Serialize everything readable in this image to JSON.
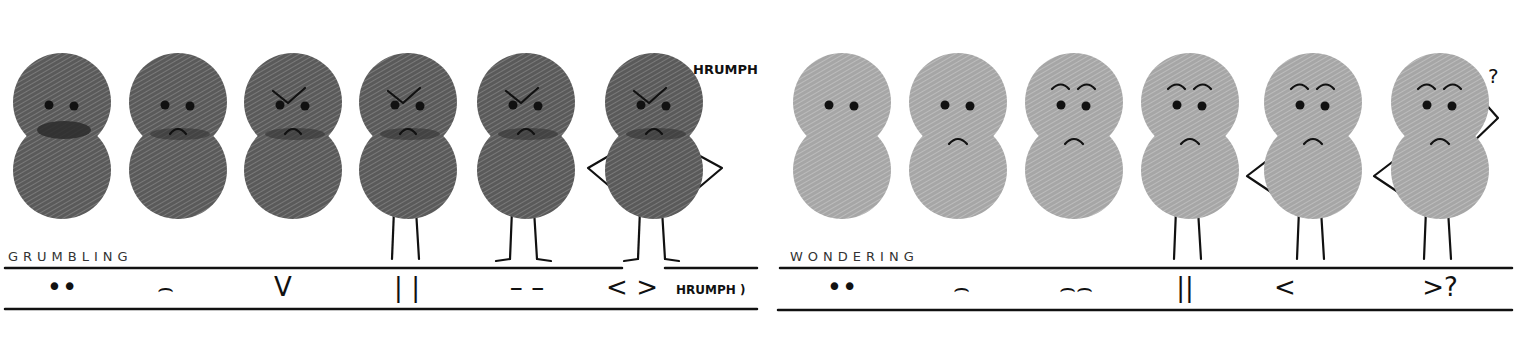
{
  "sections": [
    {
      "title": "GRUMBLING",
      "body_color": "#5e5e5e",
      "figures": [
        {
          "cx": 62,
          "eyes": true,
          "brows": "none",
          "mouth": "scribble",
          "legs": false,
          "arms": "none"
        },
        {
          "cx": 178,
          "eyes": true,
          "brows": "none",
          "mouth": "frown-scribble",
          "legs": false,
          "arms": "none"
        },
        {
          "cx": 293,
          "eyes": true,
          "brows": "angry-v",
          "mouth": "frown-scribble",
          "legs": false,
          "arms": "none"
        },
        {
          "cx": 408,
          "eyes": true,
          "brows": "angry-v",
          "mouth": "frown-scribble",
          "legs": "straight",
          "arms": "none"
        },
        {
          "cx": 526,
          "eyes": true,
          "brows": "angry-v",
          "mouth": "frown-scribble",
          "legs": "feet",
          "arms": "none"
        },
        {
          "cx": 654,
          "eyes": true,
          "brows": "angry-v",
          "mouth": "frown-scribble",
          "legs": "feet",
          "arms": "hips"
        }
      ],
      "speech": "HRUMPH",
      "legend": [
        "••",
        "⌢",
        "V",
        "| |",
        "– –",
        "< >"
      ],
      "legend_note": "HRUMPH )"
    },
    {
      "title": "WONDERING",
      "body_color": "#a9a9a9",
      "figures": [
        {
          "cx": 842,
          "eyes": true,
          "brows": "none",
          "mouth": "none",
          "legs": false,
          "arms": "none"
        },
        {
          "cx": 958,
          "eyes": true,
          "brows": "none",
          "mouth": "frown",
          "legs": false,
          "arms": "none"
        },
        {
          "cx": 1074,
          "eyes": true,
          "brows": "arched",
          "mouth": "frown",
          "legs": false,
          "arms": "none"
        },
        {
          "cx": 1190,
          "eyes": true,
          "brows": "arched",
          "mouth": "frown",
          "legs": "straight",
          "arms": "none"
        },
        {
          "cx": 1313,
          "eyes": true,
          "brows": "arched",
          "mouth": "frown",
          "legs": "straight",
          "arms": "hip-left"
        },
        {
          "cx": 1440,
          "eyes": true,
          "brows": "arched",
          "mouth": "frown",
          "legs": "straight",
          "arms": "hip-head"
        }
      ],
      "speech": "?",
      "legend": [
        "••",
        "⌢",
        "⌢⌢",
        "||",
        "<",
        ">?"
      ],
      "legend_note": ""
    }
  ],
  "legend_positions": {
    "grumbling": [
      62,
      165,
      283,
      407,
      527,
      632
    ],
    "wondering": [
      842,
      961,
      1076,
      1185,
      1285,
      1440
    ]
  }
}
